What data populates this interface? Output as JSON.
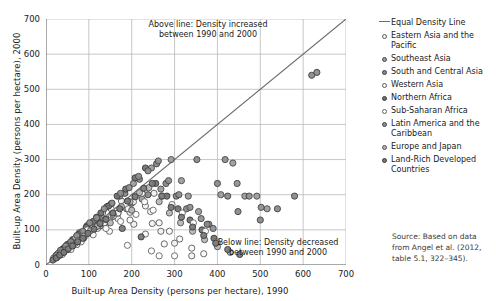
{
  "chart_data": {
    "type": "scatter",
    "title": "",
    "xlabel": "Built-up Area Density (persons per hectare), 1990",
    "ylabel": "Built-up Area Density (persons per hectare), 2000",
    "xlim": [
      0,
      700
    ],
    "ylim": [
      0,
      700
    ],
    "xticks": [
      0,
      100,
      200,
      300,
      400,
      500,
      600,
      700
    ],
    "yticks": [
      0,
      100,
      200,
      300,
      400,
      500,
      600,
      700
    ],
    "grid": true,
    "legend_position": "right",
    "reference_line": {
      "label": "Equal Density Line",
      "slope": 1,
      "intercept": 0,
      "color": "#6a6a6a"
    },
    "annotations": [
      {
        "id": "above",
        "line1": "Above line: Density increased",
        "line2": "between 1990 and 2000"
      },
      {
        "id": "below",
        "line1": "Below line: Density decreased",
        "line2": "between 1990 and 2000"
      }
    ],
    "source_note": "Source: Based on data from Angel et al. (2012, table 5.1, 322–345).",
    "series": [
      {
        "name": "Eastern Asia and the Pacific",
        "fill": "#f2f2f2",
        "stroke": "#5a5a5a",
        "points": [
          [
            18,
            20
          ],
          [
            24,
            26
          ],
          [
            30,
            34
          ],
          [
            36,
            30
          ],
          [
            42,
            48
          ],
          [
            48,
            44
          ],
          [
            55,
            62
          ],
          [
            60,
            52
          ],
          [
            68,
            70
          ],
          [
            72,
            58
          ],
          [
            80,
            88
          ],
          [
            88,
            76
          ],
          [
            95,
            104
          ],
          [
            104,
            92
          ],
          [
            112,
            120
          ],
          [
            120,
            104
          ],
          [
            132,
            148
          ],
          [
            140,
            118
          ],
          [
            152,
            160
          ],
          [
            168,
            132
          ],
          [
            176,
            182
          ],
          [
            196,
            150
          ],
          [
            208,
            196
          ],
          [
            232,
            168
          ],
          [
            248,
            118
          ],
          [
            268,
            96
          ],
          [
            300,
            62
          ],
          [
            340,
            26
          ],
          [
            205,
            116
          ],
          [
            252,
            204
          ]
        ]
      },
      {
        "name": "Southeast Asia",
        "fill": "#9a9a9a",
        "stroke": "#4a4a4a",
        "points": [
          [
            26,
            30
          ],
          [
            34,
            40
          ],
          [
            44,
            50
          ],
          [
            52,
            44
          ],
          [
            62,
            72
          ],
          [
            70,
            64
          ],
          [
            78,
            92
          ],
          [
            86,
            80
          ],
          [
            96,
            112
          ],
          [
            106,
            96
          ],
          [
            118,
            136
          ],
          [
            128,
            112
          ],
          [
            142,
            166
          ],
          [
            156,
            138
          ],
          [
            172,
            196
          ],
          [
            188,
            160
          ],
          [
            204,
            232
          ],
          [
            224,
            188
          ],
          [
            246,
            276
          ],
          [
            268,
            216
          ],
          [
            292,
            300
          ],
          [
            316,
            240
          ],
          [
            332,
            196
          ],
          [
            356,
            152
          ],
          [
            380,
            116
          ],
          [
            408,
            200
          ],
          [
            436,
            290
          ],
          [
            464,
            196
          ],
          [
            492,
            196
          ],
          [
            516,
            160
          ]
        ]
      },
      {
        "name": "South and Central Asia",
        "fill": "#888888",
        "stroke": "#3f3f3f",
        "points": [
          [
            30,
            34
          ],
          [
            40,
            46
          ],
          [
            50,
            58
          ],
          [
            60,
            52
          ],
          [
            72,
            82
          ],
          [
            84,
            74
          ],
          [
            96,
            108
          ],
          [
            108,
            94
          ],
          [
            122,
            136
          ],
          [
            136,
            118
          ],
          [
            152,
            174
          ],
          [
            168,
            148
          ],
          [
            184,
            204
          ],
          [
            200,
            176
          ],
          [
            218,
            244
          ],
          [
            238,
            200
          ],
          [
            258,
            288
          ],
          [
            280,
            232
          ],
          [
            304,
            196
          ],
          [
            328,
            160
          ],
          [
            352,
            300
          ],
          [
            376,
            116
          ],
          [
            400,
            232
          ],
          [
            424,
            196
          ],
          [
            448,
            152
          ],
          [
            620,
            540
          ],
          [
            632,
            548
          ],
          [
            580,
            196
          ],
          [
            540,
            160
          ],
          [
            500,
            128
          ]
        ]
      },
      {
        "name": "Western Asia",
        "fill": "#fafafa",
        "stroke": "#5a5a5a",
        "points": [
          [
            22,
            24
          ],
          [
            32,
            28
          ],
          [
            42,
            38
          ],
          [
            54,
            46
          ],
          [
            66,
            60
          ],
          [
            78,
            68
          ],
          [
            92,
            84
          ],
          [
            106,
            92
          ],
          [
            120,
            112
          ],
          [
            136,
            120
          ],
          [
            152,
            142
          ],
          [
            168,
            148
          ],
          [
            186,
            172
          ],
          [
            204,
            180
          ],
          [
            224,
            204
          ],
          [
            244,
            152
          ],
          [
            264,
            120
          ],
          [
            288,
            96
          ],
          [
            312,
            74
          ],
          [
            340,
            48
          ],
          [
            368,
            32
          ],
          [
            148,
            96
          ],
          [
            196,
            128
          ],
          [
            232,
            88
          ],
          [
            276,
            60
          ]
        ]
      },
      {
        "name": "Northern Africa",
        "fill": "#6f6f6f",
        "stroke": "#3a3a3a",
        "points": [
          [
            38,
            44
          ],
          [
            50,
            58
          ],
          [
            64,
            72
          ],
          [
            78,
            88
          ],
          [
            94,
            108
          ],
          [
            110,
            124
          ],
          [
            128,
            148
          ],
          [
            146,
            168
          ],
          [
            166,
            196
          ],
          [
            186,
            216
          ],
          [
            208,
            248
          ],
          [
            232,
            276
          ],
          [
            256,
            232
          ],
          [
            282,
            196
          ],
          [
            308,
            160
          ],
          [
            336,
            128
          ],
          [
            364,
            100
          ],
          [
            392,
            76
          ]
        ]
      },
      {
        "name": "Sub-Saharan Africa",
        "fill": "#ffffff",
        "stroke": "#636363",
        "points": [
          [
            20,
            18
          ],
          [
            28,
            32
          ],
          [
            38,
            30
          ],
          [
            48,
            54
          ],
          [
            58,
            44
          ],
          [
            70,
            78
          ],
          [
            82,
            66
          ],
          [
            96,
            100
          ],
          [
            110,
            86
          ],
          [
            126,
            118
          ],
          [
            140,
            104
          ],
          [
            158,
            140
          ],
          [
            174,
            124
          ],
          [
            192,
            160
          ],
          [
            210,
            144
          ],
          [
            230,
            180
          ],
          [
            250,
            156
          ],
          [
            272,
            196
          ],
          [
            294,
            172
          ],
          [
            318,
            148
          ],
          [
            344,
            120
          ],
          [
            372,
            96
          ],
          [
            400,
            64
          ],
          [
            190,
            56
          ],
          [
            246,
            40
          ],
          [
            300,
            26
          ],
          [
            264,
            26
          ]
        ]
      },
      {
        "name": "Latin America and the Caribbean",
        "fill": "#8e8e8e",
        "stroke": "#454545",
        "points": [
          [
            24,
            28
          ],
          [
            34,
            42
          ],
          [
            46,
            54
          ],
          [
            58,
            66
          ],
          [
            72,
            84
          ],
          [
            86,
            96
          ],
          [
            102,
            120
          ],
          [
            118,
            134
          ],
          [
            136,
            160
          ],
          [
            154,
            176
          ],
          [
            174,
            204
          ],
          [
            194,
            220
          ],
          [
            216,
            252
          ],
          [
            238,
            268
          ],
          [
            262,
            296
          ],
          [
            286,
            240
          ],
          [
            310,
            200
          ],
          [
            336,
            164
          ],
          [
            362,
            132
          ],
          [
            390,
            104
          ],
          [
            418,
            300
          ],
          [
            446,
            232
          ],
          [
            474,
            196
          ],
          [
            502,
            164
          ]
        ]
      },
      {
        "name": "Europe and Japan",
        "fill": "#b5b5b5",
        "stroke": "#545454",
        "points": [
          [
            26,
            22
          ],
          [
            36,
            34
          ],
          [
            48,
            44
          ],
          [
            60,
            56
          ],
          [
            74,
            70
          ],
          [
            88,
            82
          ],
          [
            104,
            98
          ],
          [
            120,
            110
          ],
          [
            138,
            130
          ],
          [
            156,
            144
          ],
          [
            176,
            166
          ],
          [
            196,
            180
          ],
          [
            218,
            206
          ],
          [
            240,
            220
          ],
          [
            264,
            180
          ],
          [
            288,
            148
          ],
          [
            314,
            120
          ],
          [
            342,
            96
          ],
          [
            370,
            72
          ],
          [
            400,
            52
          ],
          [
            430,
            36
          ],
          [
            150,
            120
          ],
          [
            200,
            156
          ]
        ]
      },
      {
        "name": "Land-Rich Developed Countries",
        "fill": "#777777",
        "stroke": "#3a3a3a",
        "points": [
          [
            16,
            14
          ],
          [
            24,
            20
          ],
          [
            32,
            28
          ],
          [
            42,
            36
          ],
          [
            52,
            46
          ],
          [
            62,
            54
          ],
          [
            74,
            66
          ],
          [
            86,
            76
          ],
          [
            98,
            90
          ],
          [
            112,
            102
          ],
          [
            126,
            118
          ],
          [
            140,
            130
          ],
          [
            156,
            148
          ],
          [
            172,
            160
          ],
          [
            190,
            182
          ],
          [
            208,
            194
          ],
          [
            228,
            218
          ],
          [
            248,
            232
          ],
          [
            270,
            196
          ],
          [
            292,
            164
          ],
          [
            316,
            136
          ],
          [
            342,
            108
          ],
          [
            368,
            84
          ],
          [
            396,
            62
          ],
          [
            424,
            44
          ],
          [
            452,
            30
          ],
          [
            178,
            104
          ],
          [
            222,
            80
          ]
        ]
      }
    ]
  },
  "legend": {
    "entries": [
      {
        "label": "Equal Density Line",
        "marker": "line"
      },
      {
        "label": "Eastern Asia and the Pacific",
        "marker": "dot"
      },
      {
        "label": "Southeast Asia",
        "marker": "dot"
      },
      {
        "label": "South and Central Asia",
        "marker": "dot"
      },
      {
        "label": "Western Asia",
        "marker": "dot"
      },
      {
        "label": "Northern Africa",
        "marker": "dot"
      },
      {
        "label": "Sub-Saharan Africa",
        "marker": "dot"
      },
      {
        "label": "Latin America and the Caribbean",
        "marker": "dot"
      },
      {
        "label": "Europe and Japan",
        "marker": "dot"
      },
      {
        "label": "Land-Rich Developed Countries",
        "marker": "dot"
      }
    ]
  },
  "colors": {
    "grid": "#b9b9b9",
    "axis": "#6f6f6f",
    "text": "#1a1a1a"
  }
}
